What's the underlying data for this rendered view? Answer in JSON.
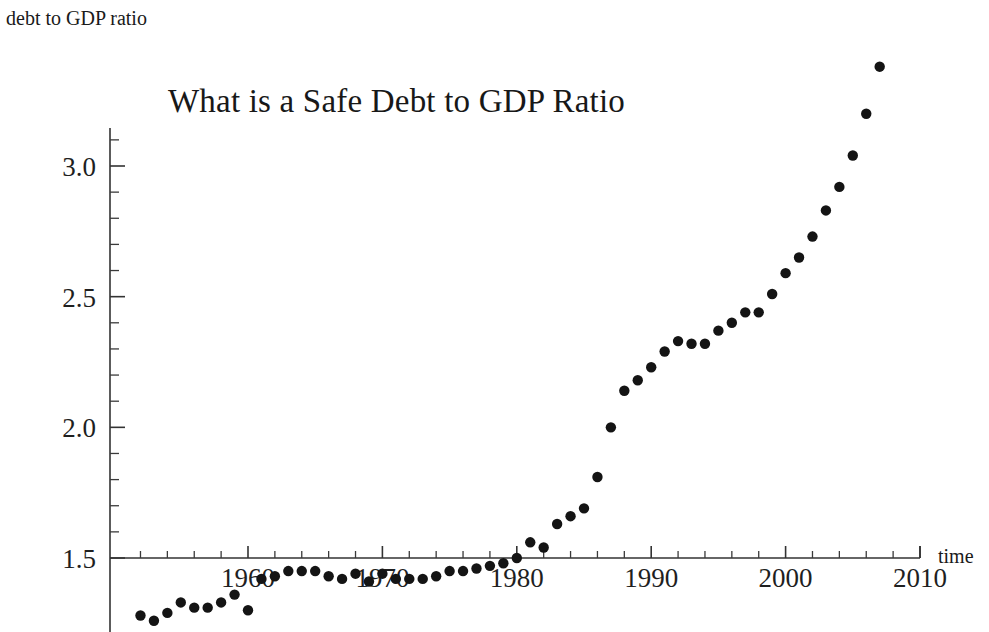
{
  "chart_data": {
    "type": "scatter",
    "title": "What is a Safe Debt to GDP Ratio",
    "xlabel": "time",
    "ylabel": "debt to GDP ratio",
    "xlim": [
      1951,
      2010
    ],
    "ylim": [
      1.24,
      3.45
    ],
    "grid": false,
    "legend": null,
    "xticks_major": [
      1960,
      1970,
      1980,
      1990,
      2000,
      2010
    ],
    "xticks_major_labels": [
      "1960",
      "1970",
      "1980",
      "1990",
      "2000",
      "2010"
    ],
    "xtick_minor_step": 2,
    "yticks_major": [
      1.5,
      2.0,
      2.5,
      3.0
    ],
    "yticks_major_labels": [
      "1.5",
      "2.0",
      "2.5",
      "3.0"
    ],
    "ytick_minor_step": 0.1,
    "marker": "filled-circle",
    "marker_color": "#141414",
    "series": [
      {
        "name": "debt to GDP ratio",
        "x": [
          1952,
          1953,
          1954,
          1955,
          1956,
          1957,
          1958,
          1959,
          1960,
          1961,
          1962,
          1963,
          1964,
          1965,
          1966,
          1967,
          1968,
          1969,
          1970,
          1971,
          1972,
          1973,
          1974,
          1975,
          1976,
          1977,
          1978,
          1979,
          1980,
          1981,
          1982,
          1983,
          1984,
          1985,
          1986,
          1987,
          1988,
          1989,
          1990,
          1991,
          1992,
          1993,
          1994,
          1995,
          1996,
          1997,
          1998,
          1999,
          2000,
          2001,
          2002,
          2003,
          2004,
          2005,
          2006,
          2007
        ],
        "values": [
          1.28,
          1.26,
          1.29,
          1.33,
          1.31,
          1.31,
          1.33,
          1.36,
          1.3,
          1.42,
          1.43,
          1.45,
          1.45,
          1.45,
          1.43,
          1.42,
          1.44,
          1.41,
          1.44,
          1.42,
          1.42,
          1.42,
          1.43,
          1.45,
          1.45,
          1.46,
          1.47,
          1.48,
          1.5,
          1.56,
          1.54,
          1.63,
          1.66,
          1.69,
          1.81,
          2.0,
          2.14,
          2.18,
          2.23,
          2.29,
          2.33,
          2.32,
          2.32,
          2.37,
          2.4,
          2.44,
          2.44,
          2.51,
          2.59,
          2.65,
          2.73,
          2.83,
          2.92,
          3.04,
          3.2,
          3.38
        ]
      }
    ]
  },
  "axes": {
    "y_axis_label": "debt to GDP ratio",
    "x_axis_label": "time"
  },
  "title": {
    "text": "What is a Safe Debt to GDP Ratio"
  }
}
